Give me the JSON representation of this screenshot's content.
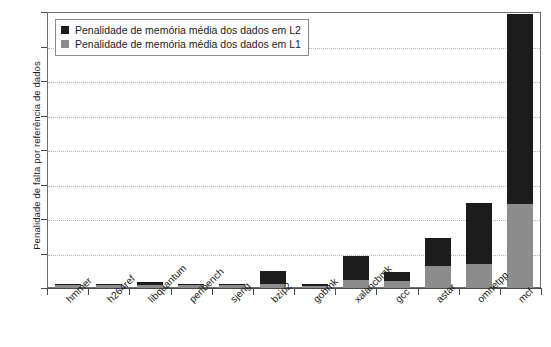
{
  "chart_data": {
    "type": "bar",
    "subtype": "stacked-bar",
    "title": "",
    "xlabel": "",
    "ylabel": "Penalidade de falta por referência de dados",
    "ylim": [
      0,
      16
    ],
    "yticks": [
      0,
      2,
      4,
      6,
      8,
      10,
      12,
      14,
      16
    ],
    "grid": true,
    "grid_axis": "y",
    "legend_position": "top-left",
    "categories": [
      "hmmer",
      "h264ref",
      "libquantum",
      "perlbench",
      "sjeng",
      "bzip2",
      "gobmk",
      "xalancbmk",
      "gcc",
      "astar",
      "omnetpp",
      "mcf"
    ],
    "series": [
      {
        "name": "Penalidade de memória média dos dados em L1",
        "color": "#8c8c8c",
        "values": [
          0.18,
          0.2,
          0.15,
          0.17,
          0.18,
          0.25,
          0.14,
          0.45,
          0.4,
          1.25,
          1.4,
          4.85
        ]
      },
      {
        "name": "Penalidade de memória média dos dados em L2",
        "color": "#1c1c1c",
        "values": [
          0.07,
          0.03,
          0.2,
          0.05,
          0.06,
          0.75,
          0.08,
          1.4,
          0.5,
          1.65,
          3.5,
          11.05
        ]
      }
    ],
    "totals": [
      0.25,
      0.23,
      0.35,
      0.22,
      0.24,
      1.0,
      0.22,
      1.85,
      0.9,
      2.9,
      4.9,
      15.9
    ]
  },
  "legend": {
    "items": [
      {
        "label": "Penalidade de memória média dos dados em L2",
        "color": "#1c1c1c"
      },
      {
        "label": "Penalidade de memória média dos dados em L1",
        "color": "#8c8c8c"
      }
    ]
  },
  "axes": {
    "y_title": "Penalidade de falta por referência de dados",
    "y_tick_labels": [
      "16",
      "14",
      "12",
      "10",
      "8",
      "6",
      "4",
      "2",
      "0"
    ]
  }
}
